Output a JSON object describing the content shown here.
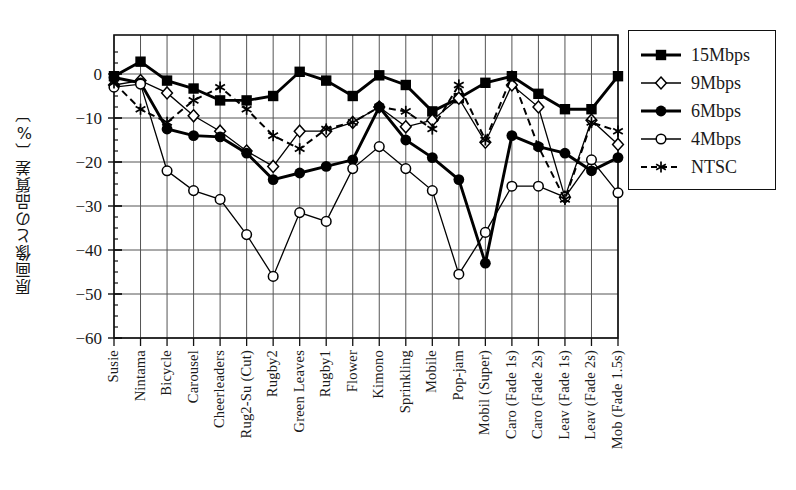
{
  "chart_data": {
    "type": "line",
    "title": "",
    "xlabel": "",
    "ylabel": "原画像との品質差〔%〕",
    "ylim": [
      -60,
      5
    ],
    "yticks": [
      0,
      -10,
      -20,
      -30,
      -40,
      -50,
      -60
    ],
    "ytick_labels": [
      "0",
      "−10",
      "−20",
      "−30",
      "−40",
      "−50",
      "−60"
    ],
    "grid": true,
    "legend_position": "right-outside",
    "categories": [
      "Susie",
      "Nintama",
      "Bicycle",
      "Carousel",
      "Cheerleaders",
      "Rug2-Su (Cut)",
      "Rugby2",
      "Green Leaves",
      "Rugby1",
      "Flower",
      "Kimono",
      "Sprinkling",
      "Mobile",
      "Pop-jam",
      "Mobil (Super)",
      "Caro (Fade 1s)",
      "Caro (Fade 2s)",
      "Leav (Fade 1s)",
      "Leav (Fade 2s)",
      "Mob (Fade 1.5s)"
    ],
    "series": [
      {
        "name": "15Mbps",
        "marker": "filled-square",
        "line": "solid-thick",
        "color": "#000000",
        "values": [
          -0.5,
          2.8,
          -1.5,
          -3.3,
          -6.0,
          -6.0,
          -5.0,
          0.5,
          -1.5,
          -5.0,
          -0.3,
          -2.5,
          -8.5,
          -5.5,
          -2.0,
          -0.5,
          -4.5,
          -8.0,
          -8.0,
          -0.5
        ]
      },
      {
        "name": "9Mbps",
        "marker": "open-diamond",
        "line": "solid-thin",
        "color": "#000000",
        "values": [
          -2.5,
          -1.5,
          -4.3,
          -9.5,
          -13.0,
          -17.5,
          -21.0,
          -13.0,
          -13.0,
          -11.0,
          -7.5,
          -12.0,
          -10.5,
          -5.5,
          -15.5,
          -2.5,
          -7.5,
          -28.0,
          -10.5,
          -16.0
        ]
      },
      {
        "name": "6Mbps",
        "marker": "filled-circle",
        "line": "solid-thick",
        "color": "#000000",
        "values": [
          -0.8,
          -2.0,
          -12.5,
          -14.0,
          -14.3,
          -18.0,
          -24.0,
          -22.5,
          -21.0,
          -19.5,
          -7.5,
          -15.0,
          -19.0,
          -24.0,
          -43.0,
          -14.0,
          -16.5,
          -18.0,
          -22.0,
          -19.0
        ]
      },
      {
        "name": "4Mbps",
        "marker": "open-circle",
        "line": "solid-thin",
        "color": "#000000",
        "values": [
          -3.0,
          -2.3,
          -22.0,
          -26.5,
          -28.5,
          -36.5,
          -46.0,
          -31.5,
          -33.5,
          -21.5,
          -16.5,
          -21.5,
          -26.5,
          -45.5,
          -36.0,
          -25.5,
          -25.5,
          -28.0,
          -19.5,
          -27.0
        ]
      },
      {
        "name": "NTSC",
        "marker": "asterisk",
        "line": "dashed",
        "color": "#000000",
        "values": [
          -2.0,
          -8.0,
          -11.0,
          -6.0,
          -3.0,
          -8.0,
          -14.0,
          -17.0,
          -12.5,
          -11.0,
          -7.5,
          -8.5,
          -12.5,
          -2.5,
          -15.0,
          -0.5,
          -16.5,
          -28.5,
          -11.0,
          -13.0
        ]
      }
    ]
  },
  "legend": {
    "items": [
      {
        "label": "15Mbps",
        "marker": "filled-square",
        "style": "solid-thick"
      },
      {
        "label": "9Mbps",
        "marker": "open-diamond",
        "style": "solid-thin"
      },
      {
        "label": "6Mbps",
        "marker": "filled-circle",
        "style": "solid-thick"
      },
      {
        "label": "4Mbps",
        "marker": "open-circle",
        "style": "solid-thin"
      },
      {
        "label": "NTSC",
        "marker": "asterisk",
        "style": "dashed"
      }
    ]
  },
  "axes": {
    "y_axis_title": "原画像との品質差〔%〕"
  }
}
